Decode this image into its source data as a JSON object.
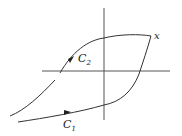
{
  "diagram": {
    "type": "hysteresis-loop",
    "labels": {
      "curve_upper": "C",
      "curve_upper_sub": "2",
      "curve_lower": "C",
      "curve_lower_sub": "1",
      "point": "x"
    },
    "colors": {
      "stroke": "#333333",
      "axis": "#555555",
      "background": "#ffffff"
    }
  }
}
